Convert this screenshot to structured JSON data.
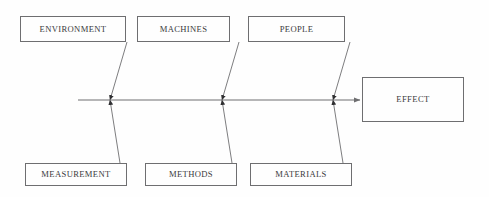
{
  "diagram": {
    "type": "fishbone-ishikawa",
    "title": "",
    "background_color": "#fefefe",
    "line_color": "#6e6e70",
    "text_color": "#3a3a3c",
    "spine": {
      "label": "",
      "x_start": 78,
      "x_end": 362,
      "y": 100
    },
    "effect": {
      "label": "EFFECT",
      "x": 362,
      "y": 77,
      "width": 102,
      "height": 45
    },
    "categories_top": [
      {
        "label": "ENVIRONMENT",
        "x": 20,
        "y": 16,
        "width": 106,
        "height": 26,
        "rib_from_x": 127,
        "rib_from_y": 42,
        "rib_to_x": 110,
        "rib_to_y": 100
      },
      {
        "label": "MACHINES",
        "x": 137,
        "y": 16,
        "width": 93,
        "height": 26,
        "rib_from_x": 239,
        "rib_from_y": 42,
        "rib_to_x": 222,
        "rib_to_y": 100
      },
      {
        "label": "PEOPLE",
        "x": 248,
        "y": 16,
        "width": 97,
        "height": 26,
        "rib_from_x": 350,
        "rib_from_y": 42,
        "rib_to_x": 333,
        "rib_to_y": 100
      }
    ],
    "categories_bottom": [
      {
        "label": "MEASUREMENT",
        "x": 25,
        "y": 163,
        "width": 102,
        "height": 23,
        "rib_from_x": 120,
        "rib_from_y": 163,
        "rib_to_x": 110,
        "rib_to_y": 100
      },
      {
        "label": "METHODS",
        "x": 145,
        "y": 163,
        "width": 92,
        "height": 23,
        "rib_from_x": 232,
        "rib_from_y": 163,
        "rib_to_x": 222,
        "rib_to_y": 100
      },
      {
        "label": "MATERIALS",
        "x": 250,
        "y": 163,
        "width": 102,
        "height": 23,
        "rib_from_x": 343,
        "rib_from_y": 163,
        "rib_to_x": 333,
        "rib_to_y": 100
      }
    ],
    "junctions": [
      {
        "x": 110,
        "y": 100
      },
      {
        "x": 222,
        "y": 100
      },
      {
        "x": 333,
        "y": 100
      }
    ]
  }
}
